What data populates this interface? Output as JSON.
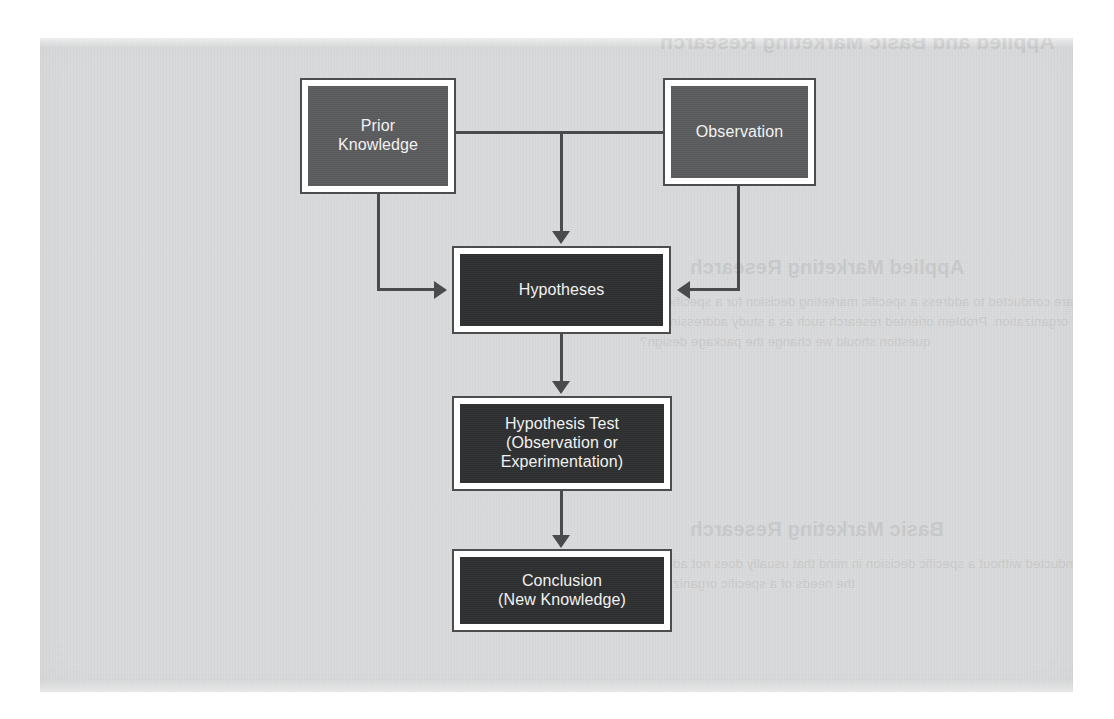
{
  "figure": {
    "type": "flowchart",
    "background_color": "#d9dadb",
    "box_border_color": "#4c4d4f",
    "connector_color": "#4a4b4d",
    "level1_fill": "#5b5c5e",
    "level2_fill": "#2f3031",
    "label_color": "#f2f2f2"
  },
  "nodes": {
    "prior_knowledge": {
      "label": "Prior\nKnowledge",
      "line1": "Prior",
      "line2": "Knowledge",
      "level": 1
    },
    "observation": {
      "label": "Observation",
      "line1": "Observation",
      "level": 1
    },
    "hypotheses": {
      "label": "Hypotheses",
      "line1": "Hypotheses",
      "level": 2
    },
    "hypothesis_test": {
      "label": "Hypothesis Test\n(Observation or\nExperimentation)",
      "line1": "Hypothesis Test",
      "line2": "(Observation or",
      "line3": "Experimentation)",
      "level": 2
    },
    "conclusion": {
      "label": "Conclusion\n(New Knowledge)",
      "line1": "Conclusion",
      "line2": "(New Knowledge)",
      "level": 2
    }
  },
  "edges": [
    {
      "from": "prior_knowledge",
      "to": "hypotheses",
      "style": "elbow-down-right",
      "arrow": "right"
    },
    {
      "from": "observation",
      "to": "hypotheses",
      "style": "elbow-down-left",
      "arrow": "left"
    },
    {
      "from": "prior_knowledge-observation-bus",
      "to": "hypotheses",
      "style": "tee-down",
      "arrow": "down"
    },
    {
      "from": "hypotheses",
      "to": "hypothesis_test",
      "style": "straight-down",
      "arrow": "down"
    },
    {
      "from": "hypothesis_test",
      "to": "conclusion",
      "style": "straight-down",
      "arrow": "down"
    }
  ],
  "bleed_through": {
    "note": "Faint mirrored show-through text from the reverse side of the printed page",
    "lines": [
      {
        "text": "Applied and Basic Marketing Research",
        "heading": true
      },
      {
        "text": "Applied Marketing Research",
        "heading": true
      },
      {
        "text": "are conducted to address a specific marketing decision for a specific firm",
        "heading": false
      },
      {
        "text": "or organization. Problem oriented research such as a study addressing the",
        "heading": false
      },
      {
        "text": "question should we change the package design?",
        "heading": false
      },
      {
        "text": "Basic Marketing Research",
        "heading": true
      },
      {
        "text": "conducted without a specific decision in mind that usually does not address",
        "heading": false
      },
      {
        "text": "the needs of a specific organization.",
        "heading": false
      }
    ]
  }
}
